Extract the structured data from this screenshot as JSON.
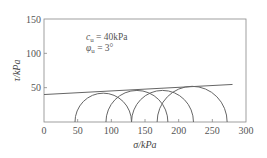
{
  "chart_data": {
    "type": "line",
    "title": "",
    "xlabel": "σ/kPa",
    "ylabel": "τ/kPa",
    "xlim": [
      0,
      300
    ],
    "ylim": [
      0,
      150
    ],
    "xticks": [
      0,
      50,
      100,
      150,
      200,
      250,
      300
    ],
    "yticks": [
      50,
      100,
      150
    ],
    "ytick_labels_shown": [
      "50",
      "100",
      "150"
    ],
    "grid": false,
    "annotations": [
      "c_u = 40kPa",
      "φ_u = 3°"
    ],
    "series": [
      {
        "name": "Strength envelope",
        "kind": "line",
        "x": [
          0,
          280
        ],
        "y": [
          40,
          54.7
        ]
      },
      {
        "name": "Mohr circles",
        "kind": "semicircles",
        "circles": [
          {
            "sigma3": 46,
            "sigma1": 130,
            "center": 88,
            "radius": 42
          },
          {
            "sigma3": 92,
            "sigma1": 184,
            "center": 138,
            "radius": 46
          },
          {
            "sigma3": 130,
            "sigma1": 222,
            "center": 176,
            "radius": 46
          },
          {
            "sigma3": 168,
            "sigma1": 272,
            "center": 220,
            "radius": 52
          }
        ]
      }
    ]
  },
  "labels": {
    "x_axis": "σ/kPa",
    "y_axis": "τ/kPa",
    "cu": "c",
    "cu_sub": "u",
    "cu_val": " = 40kPa",
    "phi": "φ",
    "phi_sub": "u",
    "phi_val": " = 3°"
  }
}
